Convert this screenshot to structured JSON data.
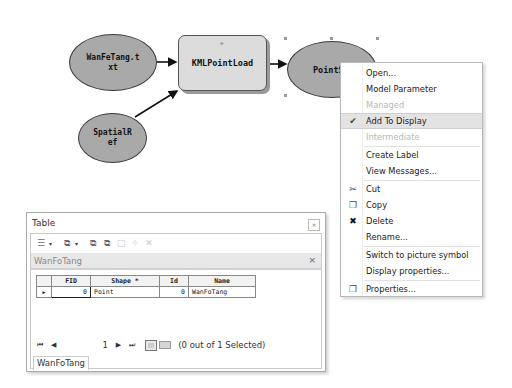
{
  "model": {
    "nodes": {
      "input_data": {
        "line1": "WanFeTang.t",
        "line2": "xt"
      },
      "spatial_ref": {
        "line1": "SpatialR",
        "line2": "ef"
      },
      "tool": {
        "label": "KMLPointLoad"
      },
      "output": {
        "label": "PointS"
      }
    },
    "colors": {
      "ellipse_fill": "#a9a9a9",
      "tool_fill": "#dcdcdc",
      "connector": "#111111"
    }
  },
  "context_menu": {
    "items": [
      {
        "label": "Open...",
        "state": "normal"
      },
      {
        "label": "Model Parameter",
        "state": "normal"
      },
      {
        "label": "Managed",
        "state": "disabled"
      },
      {
        "label": "Add To Display",
        "state": "checked",
        "icon": "✔"
      },
      {
        "label": "Intermediate",
        "state": "disabled"
      },
      {
        "label": "Create Label",
        "state": "normal"
      },
      {
        "label": "View Messages...",
        "state": "normal"
      },
      {
        "label": "Cut",
        "state": "normal",
        "icon": "✂"
      },
      {
        "label": "Copy",
        "state": "normal",
        "icon": "❐"
      },
      {
        "label": "Delete",
        "state": "normal",
        "icon": "✖"
      },
      {
        "label": "Rename...",
        "state": "normal"
      },
      {
        "label": "Switch to picture symbol",
        "state": "normal"
      },
      {
        "label": "Display properties...",
        "state": "normal"
      },
      {
        "label": "Properties...",
        "state": "normal",
        "icon": "❐"
      }
    ]
  },
  "table_window": {
    "title": "Table",
    "close_glyph": "⨯",
    "toolbar": {
      "table_options": "☰",
      "dropdown": "▾",
      "related_tables": "⧉",
      "select_by_attr": "⧉",
      "switch_selection": "⧉",
      "clear_selection": "□",
      "zoom_to_selected": "✧",
      "delete_selected": "✕"
    },
    "tab": {
      "name": "WanFoTang",
      "close": "×"
    },
    "columns": [
      "FID",
      "Shape *",
      "Id",
      "Name"
    ],
    "rows": [
      {
        "marker": "▶",
        "FID": "0",
        "Shape": "Point",
        "Id": "0",
        "Name": "WanFoTang"
      }
    ],
    "nav": {
      "first": "⏮",
      "prev": "◀",
      "page": "1",
      "next": "▶",
      "last": "⏭",
      "selected_text": "(0 out of 1 Selected)"
    },
    "bottom_tab": "WanFoTang"
  }
}
